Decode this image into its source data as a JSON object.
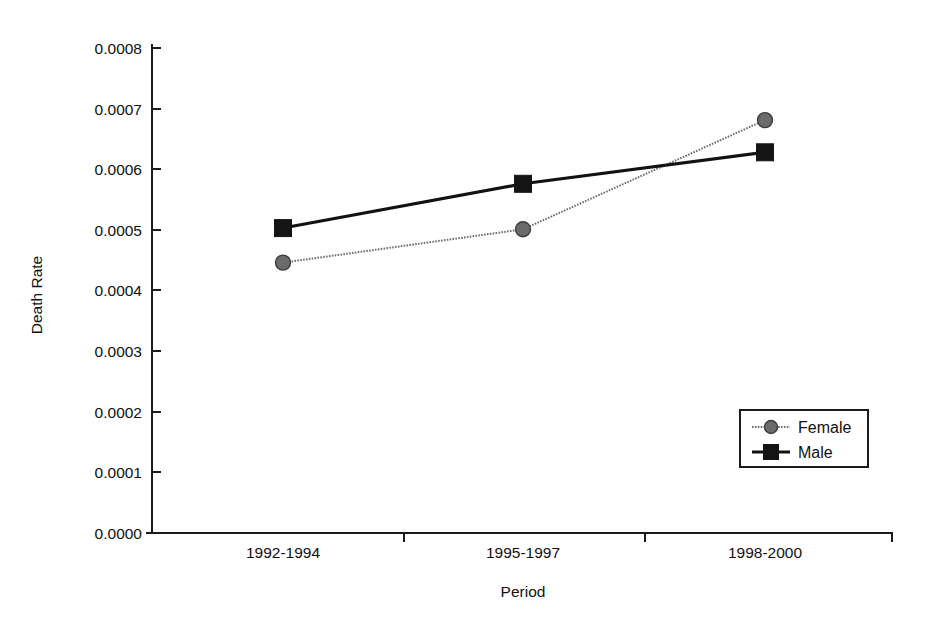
{
  "chart_data": {
    "type": "line",
    "title": "",
    "xlabel": "Period",
    "ylabel": "Death Rate",
    "categories": [
      "1992-1994",
      "1995-1997",
      "1998-2000"
    ],
    "ylim": [
      0.0,
      0.0008
    ],
    "ytick_labels": [
      "0.0000",
      "0.0001",
      "0.0002",
      "0.0003",
      "0.0004",
      "0.0005",
      "0.0006",
      "0.0007",
      "0.0008"
    ],
    "ytick_values": [
      0.0,
      0.0001,
      0.0002,
      0.0003,
      0.0004,
      0.0005,
      0.0006,
      0.0007,
      0.0008
    ],
    "grid": false,
    "legend_position": "center-right",
    "series": [
      {
        "name": "Female",
        "values": [
          0.000446,
          0.000501,
          0.000681
        ],
        "marker": "circle",
        "line_style": "dotted",
        "color": "#6e6e6e"
      },
      {
        "name": "Male",
        "values": [
          0.000503,
          0.000576,
          0.000628
        ],
        "marker": "square",
        "line_style": "solid",
        "color": "#121212"
      }
    ]
  },
  "legend": {
    "items": [
      {
        "label": "Female",
        "marker": "circle-marker"
      },
      {
        "label": "Male",
        "marker": "square-marker"
      }
    ]
  },
  "axes": {
    "y_title": "Death Rate",
    "x_title": "Period"
  }
}
